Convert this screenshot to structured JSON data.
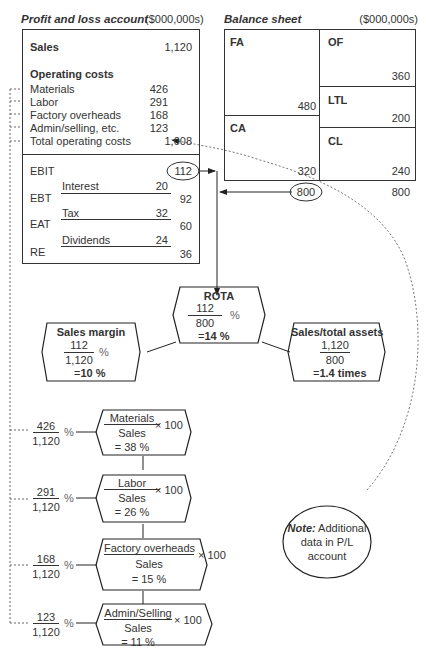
{
  "pl": {
    "title": "Profit and loss account",
    "unit": "($000,000s)",
    "sales_label": "Sales",
    "sales_value": "1,120",
    "opcosts_heading": "Operating costs",
    "items": [
      {
        "label": "Materials",
        "value": "426"
      },
      {
        "label": "Labor",
        "value": "291"
      },
      {
        "label": "Factory overheads",
        "value": "168"
      },
      {
        "label": "Admin/selling, etc.",
        "value": "123"
      }
    ],
    "total_label": "Total operating costs",
    "total_value": "1,008",
    "ebit_label": "EBIT",
    "ebit_value": "112",
    "interest_label": "Interest",
    "interest_value": "20",
    "ebt_label": "EBT",
    "ebt_value": "92",
    "tax_label": "Tax",
    "tax_value": "32",
    "eat_label": "EAT",
    "eat_value": "60",
    "dividends_label": "Dividends",
    "dividends_value": "24",
    "re_label": "RE",
    "re_value": "36"
  },
  "bs": {
    "title": "Balance sheet",
    "unit": "($000,000s)",
    "fa_label": "FA",
    "fa_value": "480",
    "ca_label": "CA",
    "ca_value": "320",
    "of_label": "OF",
    "of_value": "360",
    "ltl_label": "LTL",
    "ltl_value": "200",
    "cl_label": "CL",
    "cl_value": "240",
    "total_assets": "800",
    "total_liabilities": "800"
  },
  "rota": {
    "title": "ROTA",
    "num": "112",
    "den": "800",
    "pct": "%",
    "result_prefix": "=",
    "result": "14 %"
  },
  "margin": {
    "title": "Sales margin",
    "num": "112",
    "den": "1,120",
    "pct": "%",
    "result_prefix": "=",
    "result": "10 %"
  },
  "turnover": {
    "title": "Sales/total assets",
    "num": "1,120",
    "den": "800",
    "result_prefix": "=",
    "result": "1.4 times"
  },
  "cost_ratios": [
    {
      "num": "426",
      "den": "1,120",
      "pct": "%",
      "label": "Materials",
      "base": "Sales",
      "mult": "× 100",
      "result": "= 38 %"
    },
    {
      "num": "291",
      "den": "1,120",
      "pct": "%",
      "label": "Labor",
      "base": "Sales",
      "mult": "× 100",
      "result": "= 26 %"
    },
    {
      "num": "168",
      "den": "1,120",
      "pct": "%",
      "label": "Factory overheads",
      "base": "Sales",
      "mult": "× 100",
      "result": "= 15 %"
    },
    {
      "num": "123",
      "den": "1,120",
      "pct": "%",
      "label": "Admin/Selling",
      "base": "Sales",
      "mult": "× 100",
      "result": "= 11 %"
    }
  ],
  "note": {
    "bold": "Note:",
    "text1": " Additional",
    "text2": "data in P/L",
    "text3": "account"
  }
}
